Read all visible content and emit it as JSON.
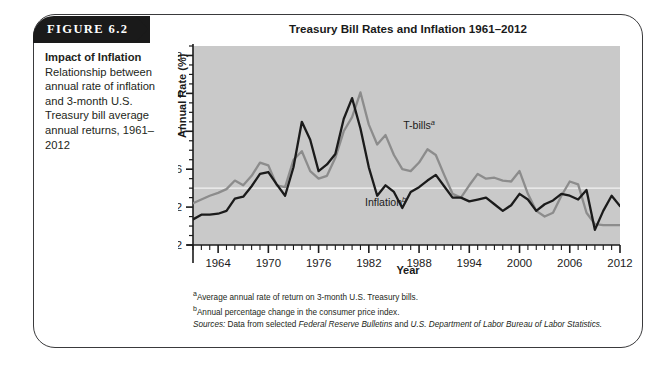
{
  "figure": {
    "banner_label": "FIGURE 6.2",
    "caption_lead": "Impact of Inflation",
    "caption_body": "Relationship between annual rate of inflation and 3-month U.S. Treasury bill average annual returns, 1961–2012"
  },
  "notes": {
    "note_a_marker": "a",
    "note_a": "Average annual rate of return on 3-month U.S. Treasury bills.",
    "note_b_marker": "b",
    "note_b": "Annual percentage change in the consumer price index.",
    "sources_label": "Sources:",
    "sources_text_1": " Data from selected ",
    "sources_italic_1": "Federal Reserve Bulletins",
    "sources_text_2": " and ",
    "sources_italic_2": "U.S. Department of Labor Bureau of Labor Statistics."
  },
  "colors": {
    "tbills": "#8c8c8c",
    "inflation": "#1b1b1b",
    "plot_background": "#c9c9c9",
    "zero_line": "#f2f2f2",
    "axis": "#1b1b1b",
    "banner": "#1a1a1a"
  },
  "chart_data": {
    "type": "line",
    "title": "Treasury Bill Rates and Inflation 1961–2012",
    "xlabel": "Year",
    "ylabel": "Annual Rate (%)",
    "xlim": [
      1961,
      2012
    ],
    "ylim": [
      -2,
      19
    ],
    "yticks": [
      -2,
      2,
      6,
      10,
      14,
      18
    ],
    "ytick_labels": [
      "-2",
      "2",
      "6",
      "10",
      "14",
      "18"
    ],
    "minor_ytick_step": 1,
    "xticks": [
      1964,
      1970,
      1976,
      1982,
      1988,
      1994,
      2000,
      2006,
      2012
    ],
    "xtick_labels": [
      "1964",
      "1970",
      "1976",
      "1982",
      "1988",
      "1994",
      "2000",
      "2006",
      "2012"
    ],
    "minor_xtick_step": 1,
    "grid": false,
    "zero_reference_line": 4,
    "legend_position": "inline-annotations",
    "annotations": [
      {
        "text": "T-bills",
        "marker": "a",
        "x": 1988,
        "y": 10.2,
        "series": "tbills"
      },
      {
        "text": "Inflation",
        "marker": "b",
        "x": 1984,
        "y": 2.1,
        "series": "inflation"
      }
    ],
    "x": [
      1961,
      1962,
      1963,
      1964,
      1965,
      1966,
      1967,
      1968,
      1969,
      1970,
      1971,
      1972,
      1973,
      1974,
      1975,
      1976,
      1977,
      1978,
      1979,
      1980,
      1981,
      1982,
      1983,
      1984,
      1985,
      1986,
      1987,
      1988,
      1989,
      1990,
      1991,
      1992,
      1993,
      1994,
      1995,
      1996,
      1997,
      1998,
      1999,
      2000,
      2001,
      2002,
      2003,
      2004,
      2005,
      2006,
      2007,
      2008,
      2009,
      2010,
      2011,
      2012
    ],
    "series": [
      {
        "name": "T-bills",
        "color": "#8c8c8c",
        "note_marker": "a",
        "description": "Average annual rate of return on 3-month U.S. Treasury bills.",
        "values": [
          2.4,
          2.8,
          3.2,
          3.5,
          3.9,
          4.8,
          4.3,
          5.3,
          6.7,
          6.4,
          4.3,
          4.1,
          7.0,
          7.9,
          5.8,
          5.0,
          5.3,
          7.2,
          10.0,
          11.5,
          14.1,
          10.7,
          8.6,
          9.6,
          7.5,
          6.0,
          5.8,
          6.7,
          8.1,
          7.5,
          5.4,
          3.4,
          3.0,
          4.3,
          5.5,
          5.0,
          5.1,
          4.8,
          4.7,
          5.8,
          3.4,
          1.6,
          1.0,
          1.4,
          3.2,
          4.7,
          4.4,
          1.4,
          0.2,
          0.1,
          0.1,
          0.1
        ]
      },
      {
        "name": "Inflation",
        "color": "#1b1b1b",
        "note_marker": "b",
        "description": "Annual percentage change in the consumer price index.",
        "values": [
          0.7,
          1.2,
          1.2,
          1.3,
          1.6,
          2.9,
          3.1,
          4.2,
          5.5,
          5.7,
          4.4,
          3.2,
          6.2,
          11.0,
          9.1,
          5.8,
          6.5,
          7.6,
          11.3,
          13.5,
          10.3,
          6.2,
          3.2,
          4.3,
          3.6,
          1.9,
          3.6,
          4.1,
          4.8,
          5.4,
          4.2,
          3.0,
          3.0,
          2.6,
          2.8,
          3.0,
          2.3,
          1.6,
          2.2,
          3.4,
          2.8,
          1.6,
          2.3,
          2.7,
          3.4,
          3.2,
          2.8,
          3.8,
          -0.4,
          1.6,
          3.2,
          2.1
        ]
      }
    ]
  }
}
